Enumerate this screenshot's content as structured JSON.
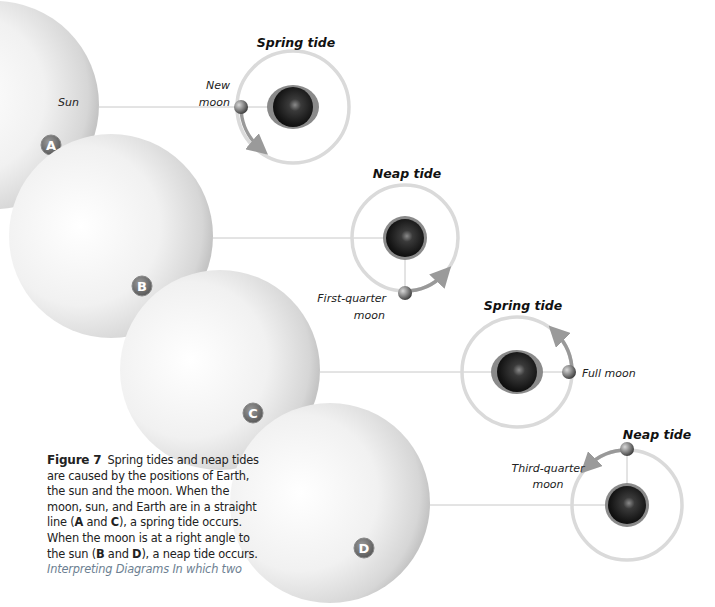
{
  "figure": {
    "number_label": "Figure 7",
    "caption_parts": [
      {
        "text": "Spring tides and neap tides are caused by the positions of Earth, the sun and the moon. When the moon, sun, and Earth are in a straight line (",
        "bold": false
      },
      {
        "text": "A",
        "bold": true
      },
      {
        "text": " and ",
        "bold": false
      },
      {
        "text": "C",
        "bold": true
      },
      {
        "text": "), a spring tide occurs. When the moon is at a right angle to the sun (",
        "bold": false
      },
      {
        "text": "B",
        "bold": true
      },
      {
        "text": " and ",
        "bold": false
      },
      {
        "text": "D",
        "bold": true
      },
      {
        "text": "), a neap tide occurs.",
        "bold": false
      }
    ],
    "interpreting_label": "Interpreting Diagrams",
    "interpreting_text": " In which two"
  },
  "panels": [
    {
      "id": "A",
      "badge": "A",
      "tide_label": "Spring tide",
      "moon_label_lines": [
        "New",
        "moon"
      ],
      "sun_label": "Sun"
    },
    {
      "id": "B",
      "badge": "B",
      "tide_label": "Neap tide",
      "moon_label_lines": [
        "First-quarter",
        "moon"
      ]
    },
    {
      "id": "C",
      "badge": "C",
      "tide_label": "Spring tide",
      "moon_label_lines": [
        "Full moon"
      ]
    },
    {
      "id": "D",
      "badge": "D",
      "tide_label": "Neap tide",
      "moon_label_lines": [
        "Third-quarter",
        "moon"
      ]
    }
  ],
  "colors": {
    "sun": "#e4e4e4",
    "orbit": "#d8d8d8",
    "arrow": "#9a9a9a",
    "earth": "#1a1a1a",
    "badge": "#707070",
    "interpreting": "#6d7f92"
  }
}
